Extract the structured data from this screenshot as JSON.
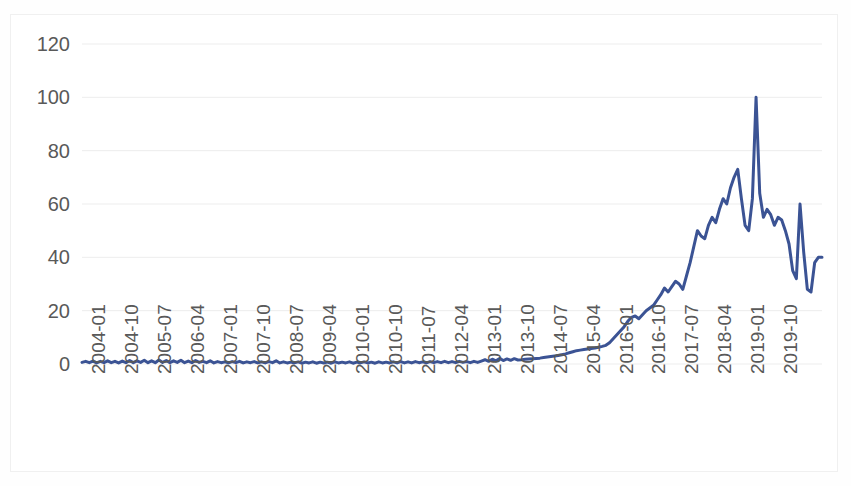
{
  "chart": {
    "title": "",
    "background_color": "#ffffff",
    "border_color": "#f0f0f0",
    "gridline_color": "#ededed",
    "tick_text_color": "#595959",
    "series_color": "#3b5394"
  },
  "chart_data": {
    "type": "line",
    "title": "",
    "subtitle": "",
    "xlabel": "",
    "ylabel": "",
    "grid": "horizontal",
    "legend": "none",
    "ylim": [
      0,
      120
    ],
    "ytick_labels": [
      "120",
      "100",
      "80",
      "60",
      "40",
      "20",
      "0"
    ],
    "ytick_values": [
      120,
      100,
      80,
      60,
      40,
      20,
      0
    ],
    "xtick_labels": [
      "2004-01",
      "2004-10",
      "2005-07",
      "2006-04",
      "2007-01",
      "2007-10",
      "2008-07",
      "2009-04",
      "2010-01",
      "2010-10",
      "2011-07",
      "2012-04",
      "2013-01",
      "2013-10",
      "2014-07",
      "2015-04",
      "2016-01",
      "2016-10",
      "2017-07",
      "2018-04",
      "2019-01",
      "2019-10"
    ],
    "xtick_interval_months": 9,
    "x_start": "2004-01",
    "x_end": "2020-05",
    "series": [
      {
        "name": "value",
        "color": "#3b5394",
        "values": [
          0.6,
          1.0,
          0.5,
          1.1,
          0.4,
          1.0,
          0.5,
          1.2,
          0.5,
          1.0,
          0.4,
          1.1,
          0.5,
          1.3,
          0.5,
          1.2,
          0.6,
          1.4,
          0.5,
          1.2,
          0.5,
          1.5,
          0.6,
          1.3,
          0.5,
          1.2,
          0.6,
          1.4,
          0.5,
          1.1,
          0.5,
          1.3,
          0.6,
          1.0,
          0.5,
          1.2,
          0.4,
          0.9,
          0.5,
          0.8,
          0.4,
          0.9,
          0.5,
          1.0,
          0.4,
          0.8,
          0.5,
          0.9,
          0.4,
          0.8,
          0.4,
          0.9,
          0.5,
          1.2,
          0.4,
          0.8,
          0.4,
          0.7,
          0.4,
          0.8,
          0.3,
          0.7,
          0.4,
          0.8,
          0.3,
          0.7,
          0.4,
          0.7,
          0.3,
          0.8,
          0.4,
          0.7,
          0.4,
          0.8,
          0.3,
          0.7,
          0.4,
          0.8,
          0.4,
          0.7,
          0.3,
          0.8,
          0.4,
          0.7,
          0.4,
          0.8,
          0.4,
          0.9,
          0.4,
          0.8,
          0.4,
          0.9,
          0.5,
          0.8,
          0.4,
          0.9,
          0.5,
          0.9,
          0.5,
          1.0,
          0.5,
          0.9,
          0.5,
          1.0,
          0.6,
          0.9,
          0.5,
          1.0,
          0.6,
          1.1,
          1.6,
          1.0,
          1.8,
          1.2,
          2.1,
          1.3,
          1.9,
          1.4,
          2.0,
          1.5,
          1.6,
          1.8,
          1.9,
          2.0,
          2.1,
          2.2,
          2.4,
          2.6,
          2.8,
          3.0,
          3.2,
          3.5,
          3.8,
          4.2,
          4.6,
          5.0,
          5.2,
          5.4,
          5.6,
          5.8,
          6.0,
          6.3,
          6.6,
          7.0,
          8.0,
          9.5,
          11.0,
          12.5,
          14.0,
          16.0,
          17.5,
          18.0,
          17.0,
          18.5,
          20.0,
          21.0,
          22.0,
          24.0,
          26.0,
          28.5,
          27.0,
          29.0,
          31.0,
          30.0,
          28.0,
          33.0,
          38.0,
          44.0,
          50.0,
          48.0,
          47.0,
          52.0,
          55.0,
          53.0,
          58.0,
          62.0,
          60.0,
          66.0,
          70.0,
          73.0,
          62.0,
          52.0,
          50.0,
          62.0,
          100.0,
          64.0,
          55.0,
          58.0,
          56.0,
          52.0,
          55.0,
          54.0,
          50.0,
          45.0,
          35.0,
          32.0,
          60.0,
          42.0,
          28.0,
          27.0,
          38.0,
          40.0,
          40.0
        ]
      }
    ]
  }
}
